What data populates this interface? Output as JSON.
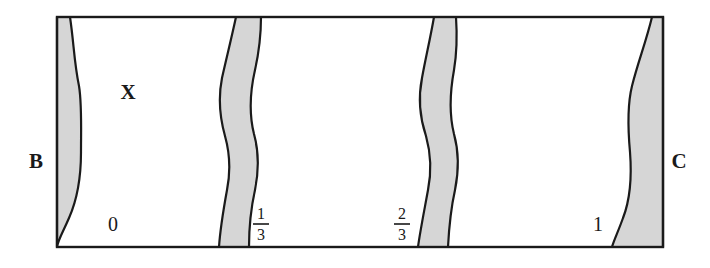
{
  "figure": {
    "background_color": "#ffffff",
    "frame": {
      "x": 57,
      "y": 17,
      "width": 606,
      "height": 230,
      "stroke_color": "#1a1a1a",
      "stroke_width": 2.4,
      "fill_color": "#ffffff"
    },
    "band_style": {
      "fill_color": "#d6d6d6",
      "stroke_color": "#1a1a1a",
      "stroke_width": 2.2
    },
    "region_label": {
      "text": "X",
      "x": 128,
      "y": 99,
      "font_size": 21,
      "weight": "bold"
    },
    "side_labels": [
      {
        "name": "left",
        "text": "B",
        "x": 36,
        "y": 168,
        "font_size": 21,
        "weight": "bold"
      },
      {
        "name": "right",
        "text": "C",
        "x": 679,
        "y": 168,
        "font_size": 21,
        "weight": "bold"
      }
    ],
    "tick_labels": [
      {
        "name": "tick-0",
        "text": "0",
        "type": "integer",
        "x": 113,
        "y": 231,
        "font_size": 20
      },
      {
        "name": "tick-1-3",
        "numerator": "1",
        "denominator": "3",
        "type": "fraction",
        "x": 261,
        "y": 222,
        "font_size": 16
      },
      {
        "name": "tick-2-3",
        "numerator": "2",
        "denominator": "3",
        "type": "fraction",
        "x": 402,
        "y": 222,
        "font_size": 16
      },
      {
        "name": "tick-1",
        "text": "1",
        "type": "integer",
        "x": 598,
        "y": 231,
        "font_size": 20
      }
    ],
    "bands": [
      {
        "name": "band-0",
        "tick": "0",
        "description": "left-edge band, thin at top widening toward bottom",
        "path": "M 57 17 L 70 17 C 74 44 74 62 79 86 C 82 104 81 130 81 152 C 81 178 77 200 69 218 C 63 232 58 240 57 247 Z"
      },
      {
        "name": "band-1-3",
        "tick": "1/3",
        "description": "S-shaped band pinched at top near one third",
        "path": "M 236 17 C 231 40 227 56 222 78 C 218 98 220 118 225 136 C 230 154 231 170 227 190 C 223 212 220 232 219 247 L 249 247 C 249 228 251 208 255 190 C 259 170 259 152 254 134 C 249 114 250 92 255 70 C 259 52 261 32 261 17 Z"
      },
      {
        "name": "band-2-3",
        "tick": "2/3",
        "description": "S-shaped band pinched at top near two thirds",
        "path": "M 434 17 C 430 40 426 56 422 78 C 418 98 420 118 426 136 C 431 154 432 170 428 190 C 424 212 420 232 418 247 L 448 247 C 449 228 451 208 455 190 C 459 170 459 152 454 134 C 449 114 450 92 454 70 C 457 52 457 32 456 17 Z"
      },
      {
        "name": "band-1",
        "tick": "1",
        "description": "right-edge band, thin at top widening toward bottom",
        "path": "M 663 17 L 652 17 C 646 42 638 62 632 86 C 627 106 628 130 630 152 C 632 178 630 200 623 218 C 618 232 614 240 612 247 L 663 247 Z"
      }
    ]
  }
}
